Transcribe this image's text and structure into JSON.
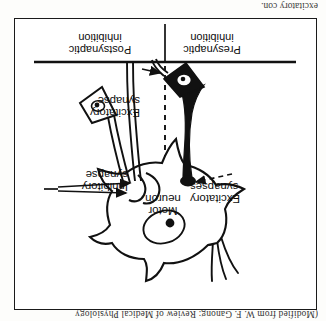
{
  "page": {
    "caption_top": "(Modified from W. F. Ganong: Review of Medical Physiology",
    "caption_bottom": "excitatory con.",
    "orientation": "rotated-180"
  },
  "figure": {
    "frame_color": "#1a1a1a",
    "background": "#ffffff",
    "labels": {
      "motor_neuron": "Motor\nneuron",
      "inhibitory_synapse": "Inhibitory\nsynapse",
      "excitatory_synapses": "Excitatory\nsynapses",
      "excitatory_synapse": "Excitatory\nsynapse",
      "postsynaptic_inhibition": "Postsynaptic\ninhibition",
      "presynaptic_inhibition": "Presynaptic\ninhibition"
    },
    "elements": {
      "soma": "star-shaped-motor-neuron-soma",
      "nucleus": "nucleus-with-nucleolus",
      "dendrite": "branching-dendrite",
      "inhibitory_terminal": "filled-black-axon-terminal",
      "excitatory_terminal_left": "filled-black-interneuron-cell-body",
      "presynaptic_cell": "outlined-presynaptic-cell-body",
      "divider_vertical": "dashed-vertical-divider",
      "divider_horizontal": "solid-horizontal-divider",
      "arrow_count_right": 2,
      "arrow_count_left": 1,
      "arrow_count_lower_left": 1
    }
  }
}
